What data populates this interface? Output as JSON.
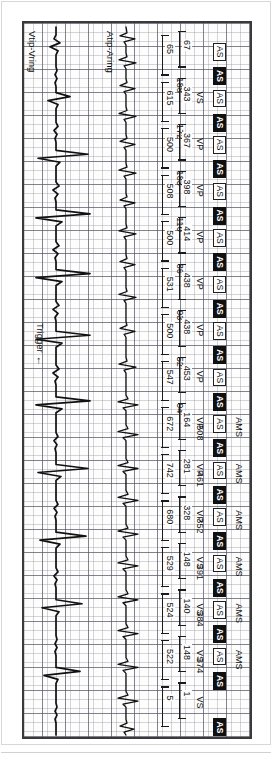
{
  "device_strip": {
    "title": "Pacemaker marker channel and intracardiac electrogram strip",
    "frame_color": "#3a3a3a",
    "grid_color": "#787882",
    "trace_color": "#111111"
  },
  "channels": [
    {
      "id": "atrial",
      "label": "Atip-Aring"
    },
    {
      "id": "ventricular",
      "label": "Vtip-Vring"
    }
  ],
  "trigger": {
    "label": "Trigger",
    "arrow": "←"
  },
  "markers": {
    "ams_label": "AMS",
    "as_label": "AS",
    "ar_label": "AS",
    "vs_label": "VS",
    "vp_label": "VP"
  },
  "beats": [
    {
      "index": 1,
      "ams": false,
      "atrial_marker": "AS",
      "atrial_marker_type": "sensed",
      "ar_marker": "AS",
      "vent_marker": "",
      "av_interval": "67",
      "vv_interval": "65",
      "partial": true
    },
    {
      "index": 2,
      "ams": false,
      "atrial_marker": "AS",
      "atrial_marker_type": "sensed",
      "ar_marker": "AS",
      "vent_marker": "VS",
      "pr_value": "188",
      "av_interval": "343",
      "vv_interval": "615"
    },
    {
      "index": 3,
      "ams": false,
      "atrial_marker": "AS",
      "atrial_marker_type": "sensed",
      "ar_marker": "AS",
      "vent_marker": "VP",
      "pr_value": "172",
      "av_interval": "367",
      "vv_interval": "500"
    },
    {
      "index": 4,
      "ams": false,
      "atrial_marker": "AS",
      "atrial_marker_type": "sensed",
      "ar_marker": "AS",
      "vent_marker": "VP",
      "pr_value": "183",
      "av_interval": "398",
      "vv_interval": "508"
    },
    {
      "index": 5,
      "ams": false,
      "atrial_marker": "AS",
      "atrial_marker_type": "sensed",
      "ar_marker": "AS",
      "vent_marker": "VP",
      "pr_value": "110",
      "av_interval": "414",
      "vv_interval": "500"
    },
    {
      "index": 6,
      "ams": false,
      "atrial_marker": "AS",
      "atrial_marker_type": "sensed",
      "ar_marker": "AS",
      "vent_marker": "VP",
      "pr_value": "86",
      "av_interval": "438",
      "vv_interval": "531"
    },
    {
      "index": 7,
      "ams": false,
      "atrial_marker": "AS",
      "atrial_marker_type": "sensed",
      "ar_marker": "AS",
      "vent_marker": "VP",
      "pr_value": "93",
      "av_interval": "438",
      "vv_interval": "500"
    },
    {
      "index": 8,
      "ams": false,
      "atrial_marker": "AS",
      "atrial_marker_type": "sensed",
      "ar_marker": "AS",
      "vent_marker": "VP",
      "pr_value": "52",
      "av_interval": "453",
      "vv_interval": "547"
    },
    {
      "index": 9,
      "ams": true,
      "atrial_marker": "AS",
      "atrial_marker_type": "sensed",
      "ar_marker": "AS",
      "vent_marker": "VP",
      "pr_value": "94",
      "ams_value": "508",
      "av_interval": "164",
      "vv_interval": "672"
    },
    {
      "index": 10,
      "ams": true,
      "atrial_marker": "AS",
      "atrial_marker_type": "sensed",
      "ar_marker": "AS",
      "vent_marker": "VP",
      "ams_value": "461",
      "av_interval": "281",
      "vv_interval": "742"
    },
    {
      "index": 11,
      "ams": true,
      "atrial_marker": "AS",
      "atrial_marker_type": "sensed",
      "ar_marker": "AS",
      "vent_marker": "VP",
      "ams_value": "352",
      "av_interval": "328",
      "vv_interval": "680"
    },
    {
      "index": 12,
      "ams": true,
      "atrial_marker": "AS",
      "atrial_marker_type": "sensed",
      "ar_marker": "AS",
      "vent_marker": "VS",
      "ams_value": "391",
      "av_interval": "148",
      "vv_interval": "529"
    },
    {
      "index": 13,
      "ams": true,
      "atrial_marker": "AS",
      "atrial_marker_type": "sensed",
      "ar_marker": "AS",
      "vent_marker": "VS",
      "ams_value": "384",
      "av_interval": "140",
      "vv_interval": "524"
    },
    {
      "index": 14,
      "ams": true,
      "atrial_marker": "AS",
      "atrial_marker_type": "sensed",
      "ar_marker": "AS",
      "vent_marker": "VS",
      "ams_value": "374",
      "av_interval": "148",
      "vv_interval": "522"
    },
    {
      "index": 15,
      "ams": false,
      "atrial_marker": "",
      "ar_marker": "AS",
      "vent_marker": "VS",
      "av_interval": "1",
      "vv_interval": "5",
      "partial": true
    }
  ],
  "chart_data": {
    "type": "line",
    "xlabel": "Time",
    "ylabel": "Amplitude",
    "grid": true,
    "legend_position": "inline-left",
    "series": [
      {
        "name": "Atip-Aring",
        "description": "Atrial electrogram channel with rapid atrial activity"
      },
      {
        "name": "Vtip-Vring",
        "description": "Ventricular electrogram channel with paced and sensed complexes"
      }
    ],
    "annotations": {
      "av_intervals_ms": [
        67,
        343,
        367,
        398,
        414,
        438,
        438,
        453,
        164,
        281,
        328,
        148,
        140,
        148
      ],
      "vv_intervals_ms": [
        65,
        615,
        500,
        508,
        500,
        531,
        500,
        547,
        672,
        742,
        680,
        529,
        524,
        522
      ],
      "pr_values_ms": [
        188,
        172,
        183,
        110,
        86,
        93,
        52,
        94
      ],
      "ams_values_ms": [
        508,
        461,
        352,
        391,
        384,
        374
      ]
    }
  }
}
